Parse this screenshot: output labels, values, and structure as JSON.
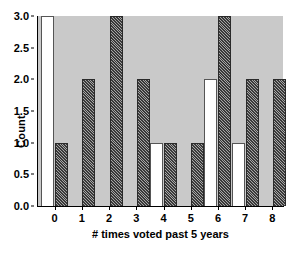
{
  "chart_data": {
    "type": "bar",
    "title": "",
    "xlabel": "# times voted past 5 years",
    "ylabel": "Count",
    "categories": [
      "0",
      "1",
      "2",
      "3",
      "4",
      "5",
      "6",
      "7",
      "8"
    ],
    "ylim": [
      0,
      3
    ],
    "ytick_labels": [
      "0.0",
      "0.5",
      "1.0",
      "1.5",
      "2.0",
      "2.5",
      "3.0"
    ],
    "ytick_values": [
      0.0,
      0.5,
      1.0,
      1.5,
      2.0,
      2.5,
      3.0
    ],
    "grid": false,
    "legend": "none",
    "plot_background": "#c9c9c9",
    "series": [
      {
        "name": "white-series",
        "style": "open-white-bar",
        "fill": "#ffffff",
        "edge": "#555555",
        "values": [
          3,
          0,
          0,
          0,
          1,
          0,
          2,
          1,
          0
        ]
      },
      {
        "name": "hatched-series",
        "style": "dark-diagonal-hatch-bar",
        "fill": "#3a3a3a",
        "edge": "#2a2a2a",
        "values": [
          1,
          2,
          3,
          2,
          1,
          1,
          3,
          2,
          2
        ]
      }
    ]
  }
}
